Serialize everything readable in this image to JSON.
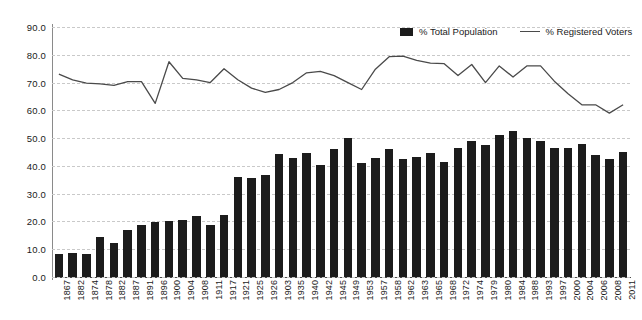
{
  "chart_data": {
    "type": "bar",
    "title": "",
    "xlabel": "",
    "ylabel": "",
    "ylim": [
      0,
      90
    ],
    "ytick_step": 10,
    "ytick_labels": [
      "0.0",
      "10.0",
      "20.0",
      "30.0",
      "40.0",
      "50.0",
      "60.0",
      "70.0",
      "80.0",
      "90.0"
    ],
    "grid": true,
    "legend_position": "top-right",
    "categories": [
      "1867",
      "1882",
      "1874",
      "1878",
      "1882",
      "1887",
      "1891",
      "1896",
      "1900",
      "1904",
      "1908",
      "1911",
      "1917",
      "1921",
      "1925",
      "1926",
      "1903",
      "1935",
      "1940",
      "1942",
      "1945",
      "1949",
      "1953",
      "1957",
      "1958",
      "1962",
      "1963",
      "1965",
      "1968",
      "1972",
      "1974",
      "1979",
      "1980",
      "1984",
      "1988",
      "1993",
      "1997",
      "2000",
      "2004",
      "2006",
      "2008",
      "2011"
    ],
    "series": [
      {
        "name": "% Total Population",
        "type": "bar",
        "color": "#1c1c1c",
        "values": [
          8.3,
          8.6,
          8.3,
          14.5,
          12.1,
          16.9,
          18.7,
          19.8,
          20.0,
          20.6,
          21.8,
          18.9,
          22.2,
          36.1,
          35.6,
          36.8,
          44.2,
          42.7,
          44.6,
          40.4,
          46.1,
          50.0,
          41.0,
          43.0,
          46.0,
          42.6,
          43.3,
          44.5,
          41.4,
          46.6,
          49.1,
          47.7,
          51.0,
          52.6,
          50.0,
          49.0,
          46.4,
          46.6,
          47.8,
          44.0,
          42.6,
          45.0
        ]
      },
      {
        "name": "% Registered Voters",
        "type": "line",
        "color": "#4a4a4a",
        "values": [
          73.0,
          71.0,
          69.8,
          69.5,
          69.0,
          70.3,
          70.3,
          62.5,
          77.5,
          71.5,
          71.0,
          70.0,
          75.0,
          71.0,
          68.0,
          66.5,
          67.5,
          70.0,
          73.5,
          74.0,
          72.5,
          70.0,
          67.5,
          74.8,
          79.3,
          79.5,
          78.0,
          77.0,
          76.8,
          72.5,
          76.5,
          70.0,
          76.0,
          72.0,
          76.0,
          76.0,
          70.5,
          66.0,
          62.0,
          62.0,
          59.0,
          62.0
        ]
      }
    ]
  },
  "legend": {
    "items": [
      {
        "label": "% Total Population",
        "marker": "bar-swatch-icon"
      },
      {
        "label": "% Registered Voters",
        "marker": "line-swatch-icon"
      }
    ]
  }
}
